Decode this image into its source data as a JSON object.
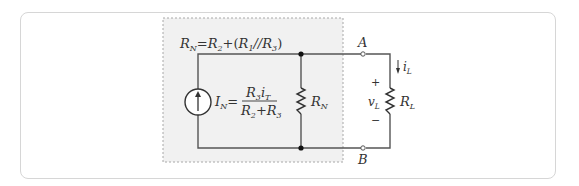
{
  "figure": {
    "type": "circuit-diagram",
    "norton_box": {
      "rn_formula": {
        "lhs": "R",
        "lhs_sub": "N",
        "eq": "=",
        "t1": "R",
        "t1_sub": "2",
        "plus": "+",
        "paren_open": "(",
        "t2": "R",
        "t2_sub": "1",
        "par": "//",
        "t3": "R",
        "t3_sub": "3",
        "paren_close": ")"
      },
      "source_formula": {
        "lhs": "I",
        "lhs_sub": "N",
        "eq": "=",
        "num_a": "R",
        "num_a_sub": "3",
        "num_b": "i",
        "num_b_sub": "T",
        "den_a": "R",
        "den_a_sub": "2",
        "den_plus": "+",
        "den_b": "R",
        "den_b_sub": "3"
      },
      "resistor_label": {
        "main": "R",
        "sub": "N"
      }
    },
    "terminals": {
      "top": "A",
      "bottom": "B"
    },
    "load": {
      "current_label": {
        "main": "i",
        "sub": "L"
      },
      "voltage_label": {
        "main": "v",
        "sub": "L"
      },
      "plus": "+",
      "minus": "−",
      "resistor_label": {
        "main": "R",
        "sub": "L"
      }
    },
    "colors": {
      "box_fill": "#f1f1f1",
      "box_border": "#a8a8a8",
      "wire": "#555555",
      "frame": "#d6d6d6"
    }
  }
}
